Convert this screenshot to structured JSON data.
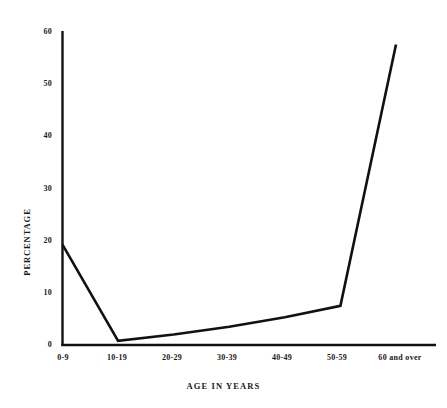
{
  "chart_data": {
    "type": "line",
    "title": "",
    "xlabel": "AGE IN YEARS",
    "ylabel": "PERCENTAGE",
    "categories": [
      "0-9",
      "10-19",
      "20-29",
      "30-39",
      "40-49",
      "50-59",
      "60 and over"
    ],
    "values": [
      19.2,
      0.8,
      2.0,
      3.5,
      5.3,
      7.5,
      57.5
    ],
    "series": [
      {
        "name": "percentage",
        "values": [
          19.2,
          0.8,
          2.0,
          3.5,
          5.3,
          7.5,
          57.5
        ]
      }
    ],
    "ylim": [
      0,
      60
    ],
    "yticks": [
      0,
      10,
      20,
      30,
      40,
      50,
      60
    ],
    "ytick_labels": [
      "0",
      "10",
      "20",
      "30",
      "40",
      "50",
      "60"
    ],
    "grid": false,
    "legend": false,
    "legend_position": "none",
    "line_color": "#111111",
    "background_color": "#ffffff",
    "axis_color": "#111111"
  }
}
